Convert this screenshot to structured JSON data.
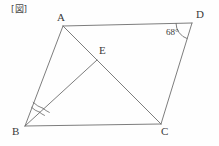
{
  "figure": {
    "caption": "[図]",
    "background_color": "#fefefe",
    "stroke_color": "#6e6e6e",
    "text_color": "#3a3a3a",
    "width": 219,
    "height": 146
  },
  "labels": {
    "A": "A",
    "B": "B",
    "C": "C",
    "D": "D",
    "E": "E"
  },
  "angles": {
    "D": "68°",
    "B_marks": 2
  },
  "points": {
    "A": {
      "x": 63,
      "y": 26
    },
    "B": {
      "x": 25,
      "y": 126
    },
    "C": {
      "x": 161,
      "y": 124
    },
    "D": {
      "x": 192,
      "y": 23
    },
    "E": {
      "x": 97,
      "y": 60
    }
  },
  "segments": [
    {
      "name": "AD",
      "from": "A",
      "to": "D"
    },
    {
      "name": "BC",
      "from": "B",
      "to": "C"
    },
    {
      "name": "AB",
      "from": "A",
      "to": "B"
    },
    {
      "name": "DC",
      "from": "D",
      "to": "C"
    },
    {
      "name": "AC",
      "from": "A",
      "to": "C"
    },
    {
      "name": "BE",
      "from": "B",
      "to": "E"
    }
  ]
}
